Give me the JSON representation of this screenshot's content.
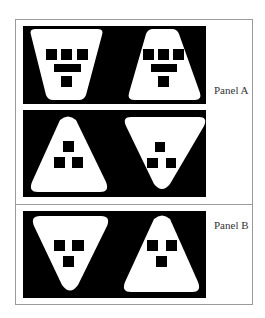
{
  "colors": {
    "background": "#ffffff",
    "frame_border": "#9a9a9a",
    "stimulus_bg": "#000000",
    "shape_fill": "#ffffff",
    "feature_fill": "#000000",
    "label_text": "#333333"
  },
  "panels": [
    {
      "label": "Panel A",
      "rows": [
        {
          "stimuli": [
            {
              "shape": "inverted-trapezoid",
              "features": "three squares, bar, one square"
            },
            {
              "shape": "upright-trapezoid",
              "features": "three squares, bar, one square"
            }
          ]
        },
        {
          "stimuli": [
            {
              "shape": "upright-triangle",
              "features": "one square above two squares"
            },
            {
              "shape": "inverted-triangle",
              "features": "one square above two squares"
            }
          ]
        }
      ]
    },
    {
      "label": "Panel B",
      "rows": [
        {
          "stimuli": [
            {
              "shape": "inverted-triangle",
              "features": "two squares above one square"
            },
            {
              "shape": "upright-triangle",
              "features": "two squares above one square"
            }
          ]
        }
      ]
    }
  ]
}
